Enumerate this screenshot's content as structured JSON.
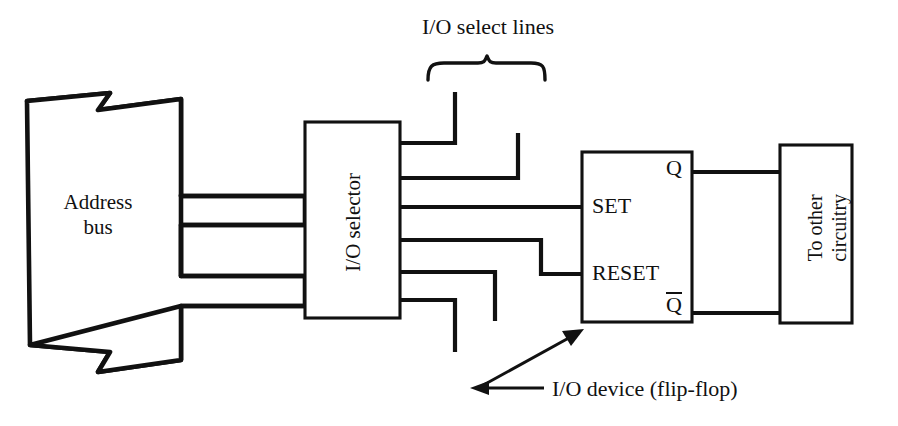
{
  "diagram": {
    "title_annotation": "I/O select lines",
    "callout": "I/O device (flip-flop)",
    "blocks": [
      {
        "id": "address-bus",
        "label_line1": "Address",
        "label_line2": "bus",
        "shape": "broken-bus"
      },
      {
        "id": "io-selector",
        "label": "I/O selector",
        "shape": "rect",
        "orientation": "vertical"
      },
      {
        "id": "flip-flop",
        "label": "",
        "shape": "rect"
      },
      {
        "id": "other-circuitry",
        "label_line1": "To other",
        "label_line2": "circuitry",
        "shape": "rect",
        "orientation": "vertical"
      }
    ],
    "pin_labels": {
      "set": "SET",
      "reset": "RESET",
      "q": "Q",
      "q_not": "Q",
      "q_not_overbar": true
    },
    "select_line_count": 6,
    "colors": {
      "ink": "#111111",
      "paper": "#ffffff"
    }
  }
}
